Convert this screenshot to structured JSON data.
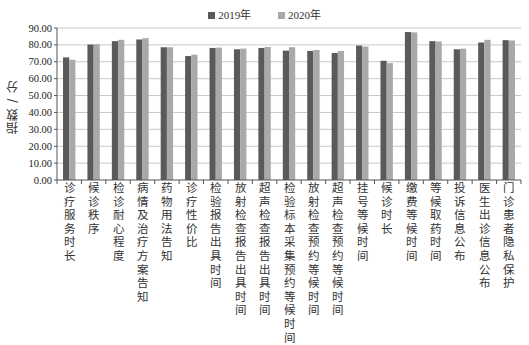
{
  "legend": [
    {
      "label": "2019年",
      "color": "#5a5a5a"
    },
    {
      "label": "2020年",
      "color": "#a9a9a9"
    }
  ],
  "axis": {
    "ylabel": "指数 / 分",
    "yticks": [
      "0.00",
      "10.00",
      "20.00",
      "30.00",
      "40.00",
      "50.00",
      "60.00",
      "70.00",
      "80.00",
      "90.00"
    ]
  },
  "chart_data": {
    "type": "bar",
    "title": "",
    "xlabel": "",
    "ylabel": "指数 / 分",
    "ylim": [
      0,
      90
    ],
    "grid": true,
    "legend_position": "top",
    "categories": [
      "诊疗服务时长",
      "候诊秩序",
      "检诊耐心程度",
      "病情及治疗方案告知",
      "药物用法告知",
      "诊疗性价比",
      "检验报告出具时间",
      "放射检查报告出具时间",
      "超声检查报告出具时间",
      "检验标本采集预约等候时间",
      "放射检查预约等候时间",
      "超声检查预约等候时间",
      "挂号等候时间",
      "候诊时长",
      "缴费等候时间",
      "等候取药时间",
      "投诉信息公布",
      "医生出诊信息公布",
      "门诊患者隐私保护"
    ],
    "series": [
      {
        "name": "2019年",
        "color": "#5a5a5a",
        "values": [
          72.6,
          80.2,
          82.2,
          83.2,
          78.6,
          73.4,
          78.2,
          77.4,
          78.2,
          76.6,
          76.4,
          75.2,
          79.6,
          70.6,
          87.6,
          82.2,
          77.4,
          81.4,
          82.8
        ]
      },
      {
        "name": "2020年",
        "color": "#a9a9a9",
        "values": [
          71.2,
          80.4,
          83.0,
          84.0,
          78.6,
          74.2,
          78.4,
          77.8,
          78.8,
          78.6,
          77.0,
          76.4,
          79.0,
          69.2,
          87.4,
          82.0,
          77.8,
          83.0,
          82.6
        ]
      }
    ]
  }
}
